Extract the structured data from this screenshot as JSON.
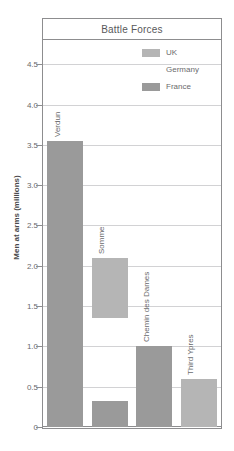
{
  "chart_data": {
    "type": "bar",
    "title": "Battle Forces",
    "xlabel": "",
    "ylabel": "Men at arms (millions)",
    "ylim": [
      0,
      4.8
    ],
    "grid": true,
    "legend_position": "top-right",
    "yticks": [
      "0",
      "0.5",
      "1.0",
      "1.5",
      "2.0",
      "2.5",
      "3.0",
      "3.5",
      "4.0",
      "4.5"
    ],
    "ytick_values": [
      0,
      0.5,
      1.0,
      1.5,
      2.0,
      2.5,
      3.0,
      3.5,
      4.0,
      4.5
    ],
    "categories": [
      "Verdun",
      "Somme",
      "Chemin des Dames",
      "Third Ypres"
    ],
    "legend": [
      {
        "name": "UK",
        "color": "#b5b5b5"
      },
      {
        "name": "Germany",
        "color": "#ffffff"
      },
      {
        "name": "France",
        "color": "#9a9a9a"
      }
    ],
    "series": [
      {
        "name": "UK",
        "values": [
          null,
          2.1,
          null,
          0.6
        ],
        "bases": [
          null,
          1.35,
          null,
          0.0
        ],
        "color": "#b5b5b5"
      },
      {
        "name": "Germany",
        "values": [
          null,
          null,
          null,
          null
        ],
        "bases": [
          null,
          null,
          null,
          null
        ],
        "color": "#ffffff"
      },
      {
        "name": "France",
        "values": [
          3.55,
          0.32,
          1.0,
          null
        ],
        "bases": [
          0.0,
          0.0,
          0.0,
          null
        ],
        "color": "#9a9a9a"
      }
    ],
    "bars": [
      {
        "category": "Verdun",
        "series": "France",
        "top": 3.55,
        "bottom": 0.0,
        "color": "#9a9a9a"
      },
      {
        "category": "Somme",
        "series": "UK",
        "top": 2.1,
        "bottom": 1.35,
        "color": "#b5b5b5"
      },
      {
        "category": "Somme",
        "series": "France",
        "top": 0.32,
        "bottom": 0.0,
        "color": "#9a9a9a"
      },
      {
        "category": "Chemin des Dames",
        "series": "France",
        "top": 1.0,
        "bottom": 0.0,
        "color": "#9a9a9a"
      },
      {
        "category": "Third Ypres",
        "series": "UK",
        "top": 0.6,
        "bottom": 0.0,
        "color": "#b5b5b5"
      }
    ]
  },
  "chart": {
    "title": "Battle Forces",
    "y_axis_title": "Men at arms (millions)",
    "ticks": {
      "t0": "0",
      "t1": "0.5",
      "t2": "1.0",
      "t3": "1.5",
      "t4": "2.0",
      "t5": "2.5",
      "t6": "3.0",
      "t7": "3.5",
      "t8": "4.0",
      "t9": "4.5"
    },
    "categories": {
      "c0": "Verdun",
      "c1": "Somme",
      "c2": "Chemin des Dames",
      "c3": "Third Ypres"
    },
    "legend": {
      "l0": "UK",
      "l1": "Germany",
      "l2": "France"
    },
    "colors": {
      "uk": "#b5b5b5",
      "germany": "#ffffff",
      "france": "#9a9a9a",
      "grid": "#d2d2d4",
      "frame": "#8d8d8f",
      "text": "#6b6b6d"
    }
  }
}
